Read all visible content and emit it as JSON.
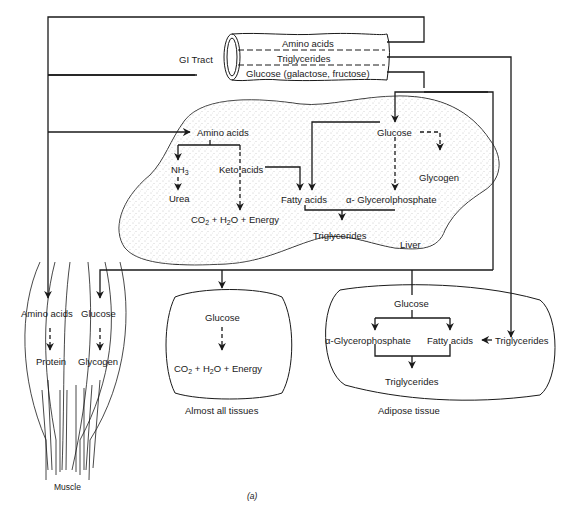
{
  "gi_tract": {
    "label": "GI Tract",
    "channels": [
      "Amino acids",
      "Triglycerides",
      "Glucose (galactose, fructose)"
    ]
  },
  "liver": {
    "label": "Liver",
    "nodes": {
      "amino_acids": "Amino acids",
      "nh3_base": "NH",
      "nh3_sub": "3",
      "keto_acids": "Keto acids",
      "urea": "Urea",
      "energy": {
        "co": "CO",
        "co_sub": "2",
        "plus1": " + H",
        "h_sub": "2",
        "rest": "O + Energy"
      },
      "fatty_acids": "Fatty acids",
      "glucose": "Glucose",
      "glycogen": "Glycogen",
      "glycerolphosphate": "α- Glycerolphosphate",
      "triglycerides": "Triglycerides"
    }
  },
  "muscle": {
    "label": "Muscle",
    "nodes": {
      "amino_acids": "Amino acids",
      "glucose": "Glucose",
      "protein": "Protein",
      "glycogen": "Glycogen"
    }
  },
  "tissues": {
    "label": "Almost all tissues",
    "nodes": {
      "glucose": "Glucose",
      "energy": {
        "co": "CO",
        "co_sub": "2",
        "plus1": " + H",
        "h_sub": "2",
        "rest": "O + Energy"
      }
    }
  },
  "adipose": {
    "label": "Adipose tissue",
    "nodes": {
      "glucose": "Glucose",
      "glycerophosphate": "α-Glycerophosphate",
      "fatty_acids": "Fatty acids",
      "triglycerides_in": "Triglycerides",
      "triglycerides_out": "Triglycerides"
    }
  },
  "figure_label": "(a)"
}
